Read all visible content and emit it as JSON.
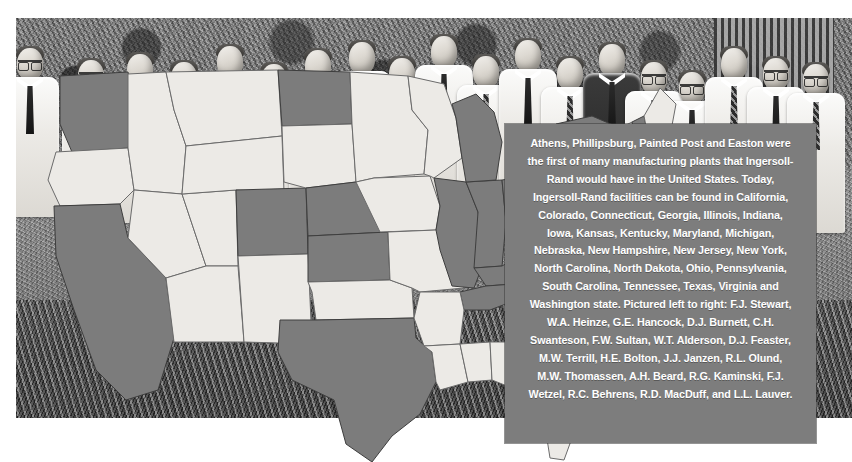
{
  "image": {
    "kind": "historical-photograph",
    "subject": "Ingersoll-Rand executives holding a cutout map of the United States",
    "alt": "Group of men in white short-sleeve shirts and ties standing behind a large cutout map of the United States with certain states shaded dark"
  },
  "caption": {
    "text": "Athens, Phillipsburg, Painted Post and Easton were the first of many manufacturing plants that Ingersoll-Rand would have in the United States.  Today, Ingersoll-Rand facilities can be found in California, Colorado, Connecticut, Georgia, Illinois, Indiana, Iowa, Kansas, Kentucky, Maryland, Michigan, Nebraska, New Hampshire, New Jersey, New York, North Carolina, North Dakota, Ohio, Pennsylvania, South Carolina, Tennessee, Texas, Virginia and Washington state.  Pictured left to right: F.J. Stewart, W.A. Heinze, G.E. Hancock, D.J. Burnett, C.H. Swanteson, F.W. Sultan, W.T. Alderson, D.J. Feaster, M.W. Terrill, H.E. Bolton, J.J. Janzen, R.L. Olund, M.W. Thomassen, A.H. Beard, R.G. Kaminski, F.J. Wetzel, R.C. Behrens, R.D. MacDuff, and L.L. Lauver.",
    "company": "Ingersoll-Rand",
    "first_plants": [
      "Athens",
      "Phillipsburg",
      "Painted Post",
      "Easton"
    ],
    "facility_states": [
      "California",
      "Colorado",
      "Connecticut",
      "Georgia",
      "Illinois",
      "Indiana",
      "Iowa",
      "Kansas",
      "Kentucky",
      "Maryland",
      "Michigan",
      "Nebraska",
      "New Hampshire",
      "New Jersey",
      "New York",
      "North Carolina",
      "North Dakota",
      "Ohio",
      "Pennsylvania",
      "South Carolina",
      "Tennessee",
      "Texas",
      "Virginia",
      "Washington"
    ],
    "people_pictured": [
      "F.J. Stewart",
      "W.A. Heinze",
      "G.E. Hancock",
      "D.J. Burnett",
      "C.H. Swanteson",
      "F.W. Sultan",
      "W.T. Alderson",
      "D.J. Feaster",
      "M.W. Terrill",
      "H.E. Bolton",
      "J.J. Janzen",
      "R.L. Olund",
      "M.W. Thomassen",
      "A.H. Beard",
      "R.G. Kaminski",
      "F.J. Wetzel",
      "R.C. Behrens",
      "R.D. MacDuff",
      "L.L. Lauver"
    ],
    "background_color": "#7d7d7d",
    "text_color": "#ffffff"
  },
  "map": {
    "title": "United States map cutout",
    "highlight_color": "#7c7c7c",
    "base_color": "#eceae6",
    "outline_color": "#3e3e3e",
    "highlighted_states": [
      "Washington",
      "California",
      "Colorado",
      "Kansas",
      "Nebraska",
      "North Dakota",
      "Texas",
      "Iowa",
      "Illinois",
      "Indiana",
      "Michigan",
      "Ohio",
      "Kentucky",
      "Tennessee",
      "Georgia",
      "South Carolina",
      "North Carolina",
      "Virginia",
      "Maryland",
      "Pennsylvania",
      "New Jersey",
      "New York",
      "Connecticut",
      "New Hampshire"
    ],
    "unhighlighted_states": [
      "Oregon",
      "Idaho",
      "Nevada",
      "Utah",
      "Arizona",
      "Montana",
      "Wyoming",
      "New Mexico",
      "Oklahoma",
      "South Dakota",
      "Minnesota",
      "Wisconsin",
      "Missouri",
      "Arkansas",
      "Louisiana",
      "Mississippi",
      "Alabama",
      "Florida",
      "West Virginia",
      "Delaware",
      "Vermont",
      "Maine",
      "Massachusetts",
      "Rhode Island"
    ]
  },
  "photo": {
    "men_count": 19,
    "attire": "white short-sleeve dress shirts with neckties",
    "setting": "outdoors in front of foliage and a shuttered building"
  }
}
